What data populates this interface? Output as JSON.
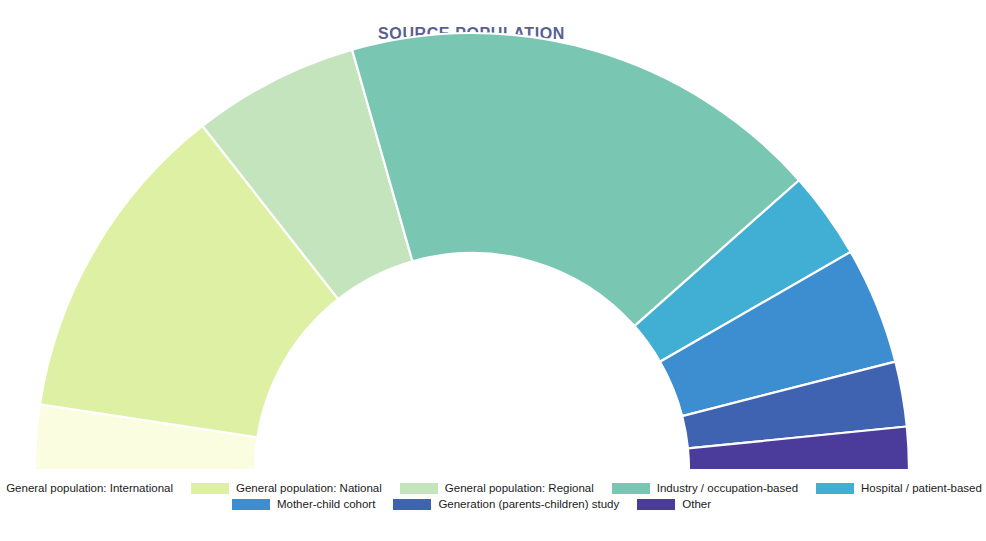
{
  "chart_data": {
    "type": "pie",
    "variant": "half-donut",
    "title": "SOURCE POPULATION",
    "xlabel": "",
    "ylabel": "",
    "grid": false,
    "legend_position": "bottom",
    "title_color": "#5a5f8f",
    "background": "#ffffff",
    "slice_border_color": "#ffffff",
    "geometry": {
      "center_x": 472,
      "center_y": 470,
      "outer_radius": 437,
      "inner_radius": 217,
      "start_angle_deg": 180,
      "end_angle_deg": 0
    },
    "categories": [
      "General population: International",
      "General population: National",
      "General population: Regional",
      "Industry / occupation-based",
      "Hospital / patient-based",
      "Mother-child cohort",
      "Generation (parents-children) study",
      "Other"
    ],
    "values": [
      5.0,
      25.0,
      12.8,
      37.2,
      6.7,
      9.0,
      5.0,
      3.3
    ],
    "colors": [
      "#fbfde0",
      "#ddf0a4",
      "#c4e4bd",
      "#79c6b2",
      "#41aed4",
      "#3d8ed0",
      "#3f63b0",
      "#4b3c9b"
    ],
    "angles_deg": [
      [
        180.0,
        171.0
      ],
      [
        171.0,
        126.0
      ],
      [
        126.0,
        103.0
      ],
      [
        103.0,
        36.0
      ],
      [
        36.0,
        24.0
      ],
      [
        24.0,
        8.0
      ],
      [
        8.0,
        -1.0
      ],
      [
        -1.0,
        0.0
      ]
    ]
  },
  "legend": {
    "rows": [
      [
        {
          "label": "General population: International",
          "color": "#fbfde0"
        },
        {
          "label": "General population: National",
          "color": "#ddf0a4"
        },
        {
          "label": "General population: Regional",
          "color": "#c4e4bd"
        },
        {
          "label": "Industry / occupation-based",
          "color": "#79c6b2"
        },
        {
          "label": "Hospital / patient-based",
          "color": "#41aed4"
        }
      ],
      [
        {
          "label": "Mother-child cohort",
          "color": "#3d8ed0"
        },
        {
          "label": "Generation (parents-children) study",
          "color": "#3f63b0"
        },
        {
          "label": "Other",
          "color": "#4b3c9b"
        }
      ]
    ]
  }
}
